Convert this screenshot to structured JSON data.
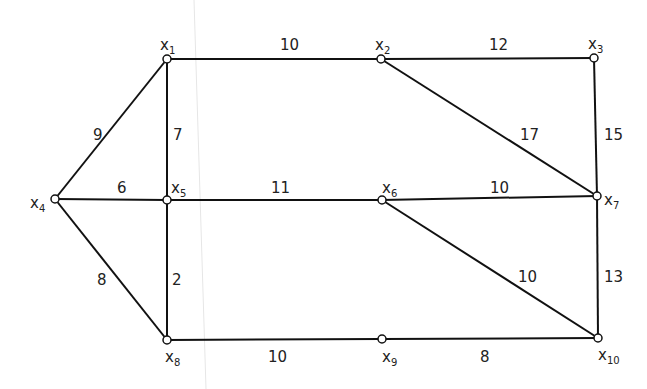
{
  "diagram": {
    "type": "weighted-graph",
    "nodes": [
      {
        "id": "x1",
        "base": "x",
        "sub": "1",
        "cx": 167,
        "cy": 59,
        "lx": 160,
        "ly": 50
      },
      {
        "id": "x2",
        "base": "x",
        "sub": "2",
        "cx": 381,
        "cy": 59,
        "lx": 375,
        "ly": 50
      },
      {
        "id": "x3",
        "base": "x",
        "sub": "3",
        "cx": 594,
        "cy": 58,
        "lx": 588,
        "ly": 49
      },
      {
        "id": "x4",
        "base": "x",
        "sub": "4",
        "cx": 55,
        "cy": 199,
        "lx": 30,
        "ly": 208
      },
      {
        "id": "x5",
        "base": "x",
        "sub": "5",
        "cx": 167,
        "cy": 200,
        "lx": 171,
        "ly": 193
      },
      {
        "id": "x6",
        "base": "x",
        "sub": "6",
        "cx": 382,
        "cy": 200,
        "lx": 382,
        "ly": 193
      },
      {
        "id": "x7",
        "base": "x",
        "sub": "7",
        "cx": 597,
        "cy": 196,
        "lx": 604,
        "ly": 205
      },
      {
        "id": "x8",
        "base": "x",
        "sub": "8",
        "cx": 167,
        "cy": 340,
        "lx": 165,
        "ly": 362
      },
      {
        "id": "x9",
        "base": "x",
        "sub": "9",
        "cx": 382,
        "cy": 339,
        "lx": 382,
        "ly": 362
      },
      {
        "id": "x10",
        "base": "x",
        "sub": "10",
        "cx": 598,
        "cy": 338,
        "lx": 598,
        "ly": 360
      }
    ],
    "edges": [
      {
        "from": "x1",
        "to": "x2",
        "weight": "10",
        "wx": 280,
        "wy": 50
      },
      {
        "from": "x2",
        "to": "x3",
        "weight": "12",
        "wx": 489,
        "wy": 50
      },
      {
        "from": "x1",
        "to": "x4",
        "weight": "9",
        "wx": 93,
        "wy": 140
      },
      {
        "from": "x1",
        "to": "x5",
        "weight": "7",
        "wx": 173,
        "wy": 140
      },
      {
        "from": "x2",
        "to": "x7",
        "weight": "17",
        "wx": 520,
        "wy": 140
      },
      {
        "from": "x3",
        "to": "x7",
        "weight": "15",
        "wx": 604,
        "wy": 140
      },
      {
        "from": "x4",
        "to": "x5",
        "weight": "6",
        "wx": 117,
        "wy": 193
      },
      {
        "from": "x5",
        "to": "x6",
        "weight": "11",
        "wx": 271,
        "wy": 193
      },
      {
        "from": "x6",
        "to": "x7",
        "weight": "10",
        "wx": 490,
        "wy": 193
      },
      {
        "from": "x4",
        "to": "x8",
        "weight": "8",
        "wx": 97,
        "wy": 285
      },
      {
        "from": "x5",
        "to": "x8",
        "weight": "2",
        "wx": 172,
        "wy": 285
      },
      {
        "from": "x6",
        "to": "x10",
        "weight": "10",
        "wx": 518,
        "wy": 282
      },
      {
        "from": "x7",
        "to": "x10",
        "weight": "13",
        "wx": 604,
        "wy": 282
      },
      {
        "from": "x8",
        "to": "x9",
        "weight": "10",
        "wx": 268,
        "wy": 362
      },
      {
        "from": "x9",
        "to": "x10",
        "weight": "8",
        "wx": 480,
        "wy": 362
      }
    ],
    "colors": {
      "line": "#111111",
      "node_fill": "#ffffff",
      "text": "#222222"
    }
  }
}
